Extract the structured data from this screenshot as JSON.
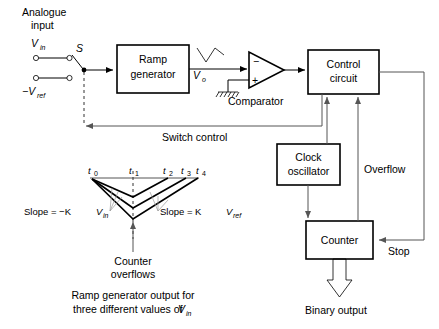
{
  "diagram": {
    "inputs": {
      "analogue_line1": "Analogue",
      "analogue_line2": "input",
      "vin_symbol": "V",
      "vin_sub": "in",
      "vref_symbol": "−V",
      "vref_sub": "ref",
      "switch_label": "S"
    },
    "blocks": {
      "ramp_generator_line1": "Ramp",
      "ramp_generator_line2": "generator",
      "control_circuit_line1": "Control",
      "control_circuit_line2": "circuit",
      "clock_oscillator_line1": "Clock",
      "clock_oscillator_line2": "oscillator",
      "counter": "Counter"
    },
    "labels": {
      "vo_symbol": "V",
      "vo_sub": "o",
      "comparator": "Comparator",
      "comparator_minus": "−",
      "comparator_plus": "+",
      "switch_control": "Switch control",
      "overflow": "Overflow",
      "stop": "Stop",
      "binary_output": "Binary output"
    },
    "graph": {
      "time_marks": [
        "t",
        "t",
        "t",
        "t",
        "t"
      ],
      "time_subs": [
        "0",
        "1",
        "2",
        "3",
        "4"
      ],
      "slope_left_prefix": "Slope = −K",
      "slope_left_symbol": "V",
      "slope_left_sub": "in",
      "slope_right_prefix": "Slope = K",
      "slope_right_symbol": "V",
      "slope_right_sub": "ref",
      "counter_overflows_line1": "Counter",
      "counter_overflows_line2": "overflows",
      "caption_line1": "Ramp generator output for",
      "caption_line2_pre": "three different values of ",
      "caption_line2_symbol": "V",
      "caption_line2_sub": "in"
    },
    "colors": {
      "ink": "#000000",
      "wire_grey": "#555555",
      "leader_grey": "#9a9a9a",
      "background": "#ffffff"
    }
  }
}
